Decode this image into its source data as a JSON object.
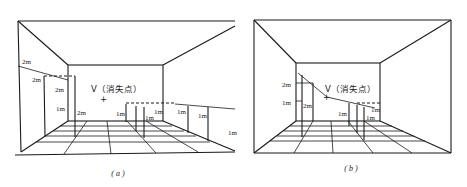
{
  "figure_a": {
    "caption": "( a )",
    "vanishing_point_label": "V（消失点）",
    "vp_marker": "+",
    "labels": {
      "left_wall_2m_outer": "2m",
      "left_wall_2m_inner": "2m",
      "left_wall_2m_back": "2m",
      "left_wall_1m": "1m",
      "left_2m_floor": "2m",
      "right_1m_a": "1m",
      "right_1m_b": "1m",
      "right_1m_c": "1m",
      "right_1m_d": "1m",
      "right_1m_e": "1m",
      "right_1m_far": "1m"
    }
  },
  "figure_b": {
    "caption": "( b )",
    "vanishing_point_label": "V（消失点）",
    "vp_marker": "+",
    "labels": {
      "left_2m": "2m",
      "left_1m": "1m",
      "left_2m_post": "2m",
      "right_1m_a": "1m",
      "right_1m_b": "1m",
      "right_1m_c": "1m"
    }
  }
}
